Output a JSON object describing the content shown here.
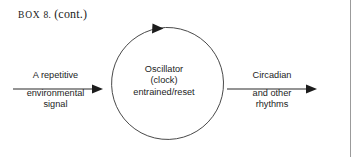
{
  "figure": {
    "title": {
      "label_caps": "BOX",
      "label_number": "8.",
      "label_cont": "(cont.)",
      "full_text": "BOX 8. (cont.)"
    },
    "background_color": "#ffffff",
    "ink_color": "#1c1c1c",
    "rule_color": "#9b9b9b"
  },
  "cycle": {
    "name": "oscillator-cycle",
    "direction": "clockwise",
    "lines": [
      "Oscillator",
      "(clock)",
      "entrained/reset"
    ]
  },
  "input": {
    "name": "input-signal",
    "top_label": "A repetitive",
    "bottom_lines": [
      "environmental",
      "signal"
    ]
  },
  "output": {
    "name": "output-rhythms",
    "top_label": "Circadian",
    "bottom_lines": [
      "and other",
      "rhythms"
    ]
  },
  "icons": {
    "arrow_right": "arrow-right-icon",
    "arrow_cycle": "circular-arrow-icon"
  }
}
